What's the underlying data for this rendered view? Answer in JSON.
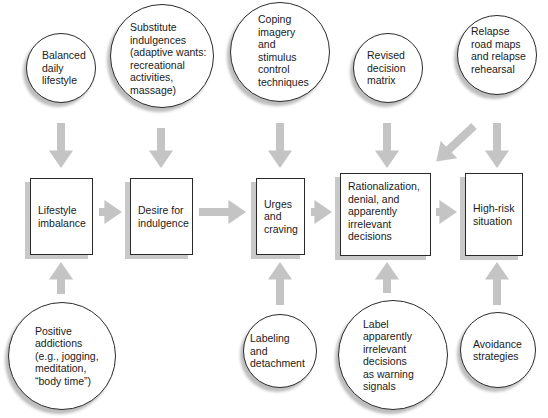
{
  "diagram": {
    "colors": {
      "arrow": "#c4c4c4",
      "border": "#2a2a2a",
      "shadow": "#c8c8c8",
      "background": "#ffffff"
    },
    "process_chain": [
      {
        "id": "lifestyle-imbalance",
        "label": "Lifestyle\nimbalance"
      },
      {
        "id": "desire-for-indulgence",
        "label": "Desire for\nindulgence"
      },
      {
        "id": "urges-and-craving",
        "label": "Urges\nand\ncraving"
      },
      {
        "id": "rationalization",
        "label": "Rationalization,\ndenial, and\napparently\nirrelevant\ndecisions"
      },
      {
        "id": "high-risk-situation",
        "label": "High-risk\nsituation"
      }
    ],
    "top_interventions": [
      {
        "id": "balanced-daily-lifestyle",
        "label": "Balanced\ndaily\nlifestyle",
        "targets": "lifestyle-imbalance"
      },
      {
        "id": "substitute-indulgences",
        "label": "Substitute\nindulgences\n(adaptive wants:\nrecreational\nactivities,\nmassage)",
        "targets": "desire-for-indulgence"
      },
      {
        "id": "coping-imagery",
        "label": "Coping\nimagery\nand\nstimulus\ncontrol\ntechniques",
        "targets": "urges-and-craving"
      },
      {
        "id": "revised-decision-matrix",
        "label": "Revised\ndecision\nmatrix",
        "targets": "rationalization"
      },
      {
        "id": "relapse-road-maps",
        "label": "Relapse\nroad maps\nand relapse\nrehearsal",
        "targets": [
          "rationalization",
          "high-risk-situation"
        ]
      }
    ],
    "bottom_interventions": [
      {
        "id": "positive-addictions",
        "label": "Positive\naddictions\n(e.g., jogging,\nmeditation,\n“body time”)",
        "targets": "lifestyle-imbalance"
      },
      {
        "id": "labeling-and-detachment",
        "label": "Labeling\nand\ndetachment",
        "targets": "urges-and-craving"
      },
      {
        "id": "label-apparently-irrelevant",
        "label": "Label\napparently\nirrelevant\ndecisions\nas warning\nsignals",
        "targets": "rationalization"
      },
      {
        "id": "avoidance-strategies",
        "label": "Avoidance\nstrategies",
        "targets": "high-risk-situation"
      }
    ]
  }
}
